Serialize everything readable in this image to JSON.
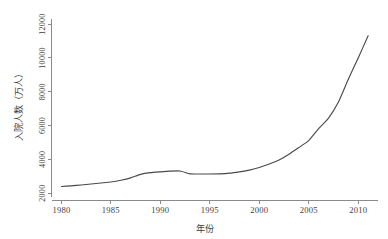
{
  "chart_data": {
    "type": "line",
    "title": "",
    "xlabel": "年份",
    "ylabel": "入院人数（万人）",
    "xlim": [
      1979,
      2012
    ],
    "ylim": [
      1800,
      12600
    ],
    "grid": false,
    "legend": "none",
    "xticks": [
      1980,
      1985,
      1990,
      1995,
      2000,
      2005,
      2010
    ],
    "xtick_labels": [
      "1980",
      "1985",
      "1990",
      "1995",
      "2000",
      "2005",
      "2010"
    ],
    "yticks": [
      2000,
      4000,
      6000,
      8000,
      10000,
      12000
    ],
    "ytick_labels": [
      "2000",
      "4000",
      "6000",
      "8000",
      "10000",
      "12000"
    ],
    "series": [
      {
        "name": "入院人数",
        "color": "#4a4a4a",
        "x": [
          1980,
          1981,
          1982,
          1983,
          1984,
          1985,
          1986,
          1987,
          1988,
          1989,
          1990,
          1991,
          1992,
          1993,
          1994,
          1995,
          1996,
          1997,
          1998,
          1999,
          2000,
          2001,
          2002,
          2003,
          2004,
          2005,
          2006,
          2007,
          2008,
          2009,
          2010,
          2011
        ],
        "y": [
          2390,
          2430,
          2480,
          2540,
          2600,
          2660,
          2760,
          2900,
          3110,
          3210,
          3260,
          3300,
          3310,
          3140,
          3130,
          3130,
          3140,
          3180,
          3260,
          3360,
          3520,
          3720,
          3960,
          4300,
          4700,
          5110,
          5820,
          6440,
          7390,
          8740,
          10000,
          11310
        ]
      }
    ],
    "annotations": []
  }
}
